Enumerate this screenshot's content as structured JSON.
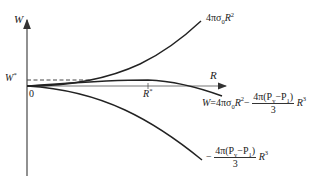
{
  "diagram": {
    "axes": {
      "y_label": "W",
      "x_label": "R",
      "origin_label": "0",
      "w_star_label": "W",
      "w_star_sup": "*",
      "r_star_label": "R",
      "r_star_sup": "*"
    },
    "curves": {
      "surface_term": {
        "prefix": "4πσ",
        "sub": "0",
        "var": "R",
        "sup": "2"
      },
      "total": {
        "lhs": "W=4πσ",
        "sub": "0",
        "var": "R",
        "sup": "2",
        "minus": "−",
        "num": "4π(P",
        "num_sub1": "v",
        "num_mid": "−P",
        "num_sub2": "1",
        "num_end": ")",
        "den": "3",
        "tail_var": "R",
        "tail_sup": "3"
      },
      "volume_term": {
        "minus": "−",
        "num": "4π(P",
        "num_sub1": "v",
        "num_mid": "−P",
        "num_sub2": "1",
        "num_end": ")",
        "den": "3",
        "tail_var": "R",
        "tail_sup": "3"
      }
    },
    "colors": {
      "curve": "#222222",
      "axis": "#444444",
      "dashed": "#444444"
    }
  }
}
